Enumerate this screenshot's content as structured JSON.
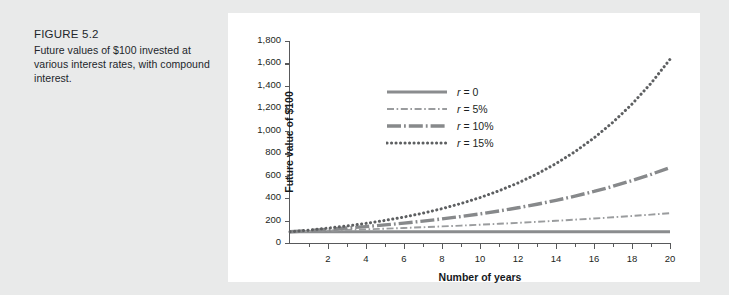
{
  "caption": {
    "figure_label": "FIGURE 5.2",
    "description": "Future values of $100 invested at various interest rates, with compound interest."
  },
  "chart_data": {
    "type": "line",
    "title": "",
    "xlabel": "Number of years",
    "ylabel": "Future value of $100",
    "xlim": [
      0,
      20
    ],
    "ylim": [
      0,
      1800
    ],
    "grid": false,
    "legend_position": "upper-left-inside",
    "x_ticks_major": [
      2,
      4,
      6,
      8,
      10,
      12,
      14,
      16,
      18,
      20
    ],
    "x_ticks_minor": [
      1,
      3,
      5,
      7,
      9,
      11,
      13,
      15,
      17,
      19
    ],
    "x_tick_labels": [
      "2",
      "4",
      "6",
      "8",
      "10",
      "12",
      "14",
      "16",
      "18",
      "20"
    ],
    "y_ticks": [
      0,
      200,
      400,
      600,
      800,
      1000,
      1200,
      1400,
      1600,
      1800
    ],
    "y_tick_labels": [
      "0",
      "200",
      "400",
      "600",
      "800",
      "1,000",
      "1,200",
      "1,400",
      "1,600",
      "1,800"
    ],
    "x": [
      0,
      1,
      2,
      3,
      4,
      5,
      6,
      7,
      8,
      9,
      10,
      11,
      12,
      13,
      14,
      15,
      16,
      17,
      18,
      19,
      20
    ],
    "series": [
      {
        "name": "r = 0",
        "rate_label": "0",
        "rate": 0,
        "style": "solid",
        "color": "#8a8c8e",
        "values": [
          100,
          100,
          100,
          100,
          100,
          100,
          100,
          100,
          100,
          100,
          100,
          100,
          100,
          100,
          100,
          100,
          100,
          100,
          100,
          100,
          100
        ]
      },
      {
        "name": "r = 5%",
        "rate_label": "5%",
        "rate": 0.05,
        "style": "dash-dot-thin",
        "color": "#9a9c9e",
        "values": [
          100,
          105,
          110.3,
          115.8,
          121.6,
          127.6,
          134,
          140.7,
          147.7,
          155.1,
          162.9,
          171,
          179.6,
          188.6,
          198,
          207.9,
          218.3,
          229.2,
          240.7,
          252.7,
          265.3
        ]
      },
      {
        "name": "r = 10%",
        "rate_label": "10%",
        "rate": 0.1,
        "style": "dash-dot-thick",
        "color": "#87898b",
        "values": [
          100,
          110,
          121,
          133.1,
          146.4,
          161.1,
          177.2,
          194.9,
          214.4,
          235.8,
          259.4,
          285.3,
          313.8,
          345.2,
          379.7,
          417.7,
          459.5,
          505.4,
          555.9,
          611.6,
          672.7
        ]
      },
      {
        "name": "r = 15%",
        "rate_label": "15%",
        "rate": 0.15,
        "style": "dotted",
        "color": "#5d5f61",
        "values": [
          100,
          115,
          132.3,
          152.1,
          174.9,
          201.1,
          231.3,
          266,
          305.9,
          351.8,
          404.6,
          465.2,
          535,
          615.3,
          707.6,
          813.7,
          935.8,
          1076.3,
          1237.7,
          1423.2,
          1636.7
        ]
      }
    ]
  },
  "legend": {
    "prefix": "r",
    "equals": "=",
    "entries": [
      "0",
      "5%",
      "10%",
      "15%"
    ]
  }
}
